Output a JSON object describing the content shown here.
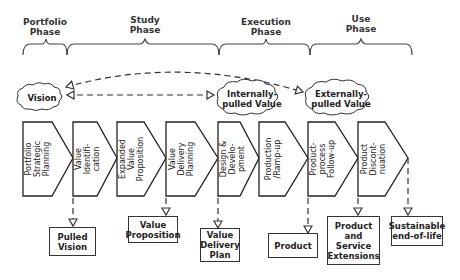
{
  "phases": [
    {
      "id": "portfolio",
      "label": "Portfolio\nPhase",
      "x_start": 23,
      "x_end": 67
    },
    {
      "id": "study",
      "label": "Study\nPhase",
      "x_start": 67,
      "x_end": 219
    },
    {
      "id": "execution",
      "label": "Execution\nPhase",
      "x_start": 219,
      "x_end": 310
    },
    {
      "id": "use",
      "label": "Use\nPhase",
      "x_start": 310,
      "x_end": 412
    }
  ],
  "clouds": [
    {
      "id": "vision",
      "label": "Vision"
    },
    {
      "id": "internally-pulled-value",
      "label": "Internally-\npulled Value"
    },
    {
      "id": "externally-pulled-value",
      "label": "Externally-\npulled Value"
    }
  ],
  "steps": [
    {
      "id": "portfolio-strategic-planning",
      "label": "Portfolio\nStrategic\nPlanning"
    },
    {
      "id": "value-identification",
      "label": "Value\nIdentifi-\ncation"
    },
    {
      "id": "expanded-value-proposition",
      "label": "Expanded\nValue\nProposition"
    },
    {
      "id": "value-delivery-planning",
      "label": "Value\nDelivery\nPlanning"
    },
    {
      "id": "design-development",
      "label": "Design &\nDevelo-\npment"
    },
    {
      "id": "production-ramp-up",
      "label": "Production\n/Ramp-up"
    },
    {
      "id": "product-process-follow-up",
      "label": "Product-\nprocess\nFollow-up"
    },
    {
      "id": "product-discontinuation",
      "label": "Product\nDiscont-\nnuation"
    }
  ],
  "outputs": [
    {
      "id": "pulled-vision",
      "label": "Pulled\nVision"
    },
    {
      "id": "value-proposition",
      "label": "Value\nProposition"
    },
    {
      "id": "value-delivery-plan",
      "label": "Value\nDelivery\nPlan"
    },
    {
      "id": "product",
      "label": "Product"
    },
    {
      "id": "product-service-extensions",
      "label": "Product\nand\nService\nExtensions"
    },
    {
      "id": "sustainable-end-of-life",
      "label": "Sustainable\nend-of-life"
    }
  ]
}
